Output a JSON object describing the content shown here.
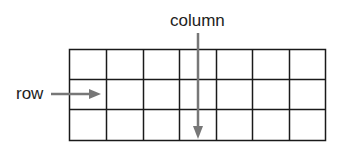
{
  "diagram": {
    "title_labels": {
      "column": "column",
      "row": "row"
    },
    "grid": {
      "rows": 3,
      "columns": 7,
      "line_color": "#1a1a1a"
    },
    "arrow_color": "#777777"
  }
}
